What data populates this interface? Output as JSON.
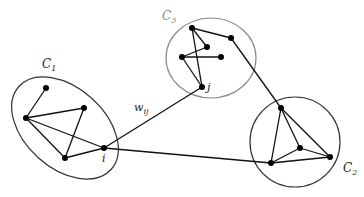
{
  "diagram": {
    "colors": {
      "edge": "#111111",
      "node": "#000000",
      "cluster_outline": "#333333",
      "cluster_outline_light": "#8a8a8a",
      "label": "#222222",
      "label_light": "#8a8a8a"
    },
    "clusters": [
      {
        "id": "C1",
        "label": "C",
        "sub": "1",
        "shape": "ellipse",
        "cx": 65,
        "cy": 128,
        "rx": 62,
        "ry": 40,
        "rotate": 42,
        "label_x": 42,
        "label_y": 68,
        "light": false
      },
      {
        "id": "C2",
        "label": "C",
        "sub": "2",
        "shape": "ellipse",
        "cx": 295,
        "cy": 142,
        "rx": 45,
        "ry": 45,
        "rotate": 0,
        "label_x": 343,
        "label_y": 172,
        "light": false
      },
      {
        "id": "C3",
        "label": "C",
        "sub": "3",
        "shape": "ellipse",
        "cx": 211,
        "cy": 58,
        "rx": 45,
        "ry": 40,
        "rotate": 0,
        "label_x": 162,
        "label_y": 20,
        "light": true
      }
    ],
    "nodes": [
      {
        "id": "a1",
        "x": 46,
        "y": 88,
        "cluster": "C1"
      },
      {
        "id": "a2",
        "x": 26,
        "y": 118,
        "cluster": "C1"
      },
      {
        "id": "a3",
        "x": 84,
        "y": 108,
        "cluster": "C1"
      },
      {
        "id": "a4",
        "x": 65,
        "y": 158,
        "cluster": "C1"
      },
      {
        "id": "i",
        "x": 104,
        "y": 148,
        "cluster": "C1",
        "label": "i",
        "label_dx": -2,
        "label_dy": 14
      },
      {
        "id": "b1",
        "x": 281,
        "y": 108,
        "cluster": "C2"
      },
      {
        "id": "b2",
        "x": 300,
        "y": 148,
        "cluster": "C2"
      },
      {
        "id": "b3",
        "x": 330,
        "y": 157,
        "cluster": "C2"
      },
      {
        "id": "b4",
        "x": 271,
        "y": 163,
        "cluster": "C2"
      },
      {
        "id": "c1",
        "x": 192,
        "y": 28,
        "cluster": "C3"
      },
      {
        "id": "c2",
        "x": 231,
        "y": 38,
        "cluster": "C3"
      },
      {
        "id": "c3",
        "x": 207,
        "y": 47,
        "cluster": "C3"
      },
      {
        "id": "c4",
        "x": 182,
        "y": 57,
        "cluster": "C3"
      },
      {
        "id": "c5",
        "x": 221,
        "y": 57,
        "cluster": "C3"
      },
      {
        "id": "j",
        "x": 202,
        "y": 87,
        "cluster": "C3",
        "label": "j",
        "label_dx": 5,
        "label_dy": 4
      }
    ],
    "edges": [
      [
        "a1",
        "a2"
      ],
      [
        "a2",
        "a3"
      ],
      [
        "a2",
        "a4"
      ],
      [
        "a2",
        "i"
      ],
      [
        "a3",
        "a4"
      ],
      [
        "a4",
        "i"
      ],
      [
        "i",
        "j"
      ],
      [
        "i",
        "b4"
      ],
      [
        "c1",
        "c2"
      ],
      [
        "c1",
        "c3"
      ],
      [
        "c1",
        "j"
      ],
      [
        "c3",
        "c4"
      ],
      [
        "c4",
        "c5"
      ],
      [
        "c4",
        "j"
      ],
      [
        "c2",
        "b1"
      ],
      [
        "b1",
        "b4"
      ],
      [
        "b1",
        "b2"
      ],
      [
        "b1",
        "b3"
      ],
      [
        "b2",
        "b4"
      ],
      [
        "b2",
        "b3"
      ],
      [
        "b4",
        "b3"
      ]
    ],
    "edge_labels": [
      {
        "from": "i",
        "to": "j",
        "text": "w",
        "sub": "ij",
        "x": 134,
        "y": 111
      }
    ]
  }
}
